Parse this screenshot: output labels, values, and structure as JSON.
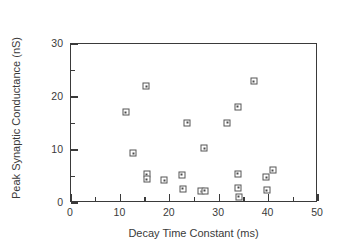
{
  "chart_data": {
    "type": "scatter",
    "title": "",
    "xlabel": "Decay Time Constant (ms)",
    "ylabel": "Peak Synaptic Conductance (nS)",
    "xlim": [
      0,
      50
    ],
    "ylim": [
      0,
      30
    ],
    "grid": false,
    "legend": null,
    "x_major_ticks": [
      0,
      10,
      20,
      30,
      40,
      50
    ],
    "y_major_ticks": [
      0,
      10,
      20,
      30
    ],
    "x_minor_ticks": [
      5,
      15,
      25,
      35,
      45
    ],
    "y_minor_ticks": [
      5,
      15,
      25
    ],
    "x_tick_labels": [
      "0",
      "10",
      "20",
      "30",
      "40",
      "50"
    ],
    "y_tick_labels": [
      "0",
      "10",
      "20",
      "30"
    ],
    "marker": "open-square",
    "marker_color": "#545454",
    "points": [
      {
        "x": 11.1,
        "y": 17.1
      },
      {
        "x": 12.6,
        "y": 9.4
      },
      {
        "x": 15.2,
        "y": 22.0
      },
      {
        "x": 15.3,
        "y": 5.4
      },
      {
        "x": 15.3,
        "y": 4.5
      },
      {
        "x": 18.9,
        "y": 4.3
      },
      {
        "x": 22.4,
        "y": 5.3
      },
      {
        "x": 22.6,
        "y": 2.7
      },
      {
        "x": 23.5,
        "y": 15.1
      },
      {
        "x": 26.4,
        "y": 2.2
      },
      {
        "x": 27.1,
        "y": 2.3
      },
      {
        "x": 27.0,
        "y": 10.3
      },
      {
        "x": 31.6,
        "y": 15.1
      },
      {
        "x": 33.8,
        "y": 18.2
      },
      {
        "x": 33.8,
        "y": 5.5
      },
      {
        "x": 33.9,
        "y": 2.9
      },
      {
        "x": 34.0,
        "y": 1.2
      },
      {
        "x": 37.0,
        "y": 23.0
      },
      {
        "x": 39.5,
        "y": 4.9
      },
      {
        "x": 39.6,
        "y": 2.4
      },
      {
        "x": 40.8,
        "y": 6.2
      }
    ]
  },
  "colors": {
    "axis": "#3a3a3a",
    "marker": "#545454",
    "background": "#ffffff"
  }
}
